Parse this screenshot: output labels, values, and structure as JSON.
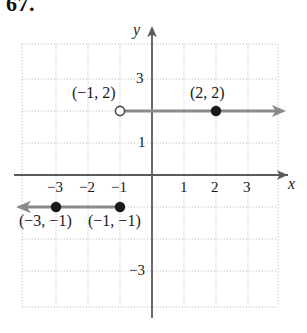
{
  "problem": {
    "number": "67."
  },
  "figure": {
    "type": "piecewise-step-function-graph",
    "axes": {
      "x_axis_label": "x",
      "y_axis_label": "y",
      "x_tick_labels": [
        "−3",
        "−2",
        "−1",
        "1",
        "2",
        "3"
      ],
      "y_tick_labels": [
        "3",
        "1",
        "−3"
      ],
      "x_range": [
        -4,
        4
      ],
      "y_range": [
        -4,
        4
      ],
      "grid": true,
      "grid_style": "dotted"
    },
    "point_labels": [
      {
        "text": "(−1, 2)",
        "x": -1,
        "y": 2
      },
      {
        "text": "(2, 2)",
        "x": 2,
        "y": 2
      },
      {
        "text": "(−3, −1)",
        "x": -3,
        "y": -1
      },
      {
        "text": "(−1, −1)",
        "x": -1,
        "y": -1
      }
    ],
    "rays": [
      {
        "name": "upper-ray",
        "y": 2,
        "from_x": -1,
        "direction": "right",
        "endpoint": "open",
        "has_arrow": true
      },
      {
        "name": "lower-ray",
        "y": -1,
        "from_x": -1,
        "direction": "left",
        "endpoint": "closed",
        "has_arrow": true
      }
    ],
    "markers": [
      {
        "name": "open-circle-neg1-2",
        "x": -1,
        "y": 2,
        "filled": false
      },
      {
        "name": "closed-dot-2-2",
        "x": 2,
        "y": 2,
        "filled": true
      },
      {
        "name": "closed-dot-neg3-neg1",
        "x": -3,
        "y": -1,
        "filled": true
      },
      {
        "name": "closed-dot-neg1-neg1",
        "x": -1,
        "y": -1,
        "filled": true
      }
    ],
    "colors": {
      "axis": "#555555",
      "grid": "#b9b9b9",
      "ray": "#8a8a8a",
      "marker": "#1a1a1a",
      "text": "#1a1a1a"
    }
  }
}
